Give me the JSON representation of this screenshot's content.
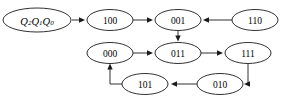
{
  "diagram": {
    "kind": "state-transition-diagram",
    "title": "",
    "background_color": "#ffffff",
    "stroke_color": "#1a1a1a",
    "label_color": "#000000",
    "legend": {
      "name": "state-encoding-legend",
      "text": "Q2Q1Q0",
      "parts": [
        {
          "base": "Q",
          "sub": "2"
        },
        {
          "base": "Q",
          "sub": "1"
        },
        {
          "base": "Q",
          "sub": "0"
        }
      ],
      "cx": 37,
      "cy": 20,
      "rx": 34,
      "ry": 12
    },
    "nodes": [
      {
        "id": "100",
        "label": "100",
        "cx": 110,
        "cy": 20,
        "rx": 23,
        "ry": 10.5,
        "row": "top"
      },
      {
        "id": "001",
        "label": "001",
        "cx": 178,
        "cy": 20,
        "rx": 23,
        "ry": 10.5,
        "row": "top"
      },
      {
        "id": "110",
        "label": "110",
        "cx": 255,
        "cy": 20,
        "rx": 23,
        "ry": 10.5,
        "row": "top"
      },
      {
        "id": "000",
        "label": "000",
        "cx": 110,
        "cy": 53,
        "rx": 23,
        "ry": 10.5,
        "row": "middle"
      },
      {
        "id": "011",
        "label": "011",
        "cx": 178,
        "cy": 53,
        "rx": 23,
        "ry": 10.5,
        "row": "middle"
      },
      {
        "id": "111",
        "label": "111",
        "cx": 248,
        "cy": 53,
        "rx": 23,
        "ry": 10.5,
        "row": "middle"
      },
      {
        "id": "101",
        "label": "101",
        "cx": 145,
        "cy": 84,
        "rx": 23,
        "ry": 10.5,
        "row": "bottom"
      },
      {
        "id": "010",
        "label": "010",
        "cx": 220,
        "cy": 84,
        "rx": 23,
        "ry": 10.5,
        "row": "bottom"
      }
    ],
    "edges": [
      {
        "id": "legend-to-100",
        "from": "Q2Q1Q0",
        "to": "100",
        "shape": "straight",
        "points": "72,20 85,20",
        "arrow_at": "85,20",
        "arrow_dir": "right"
      },
      {
        "id": "100-to-001",
        "from": "100",
        "to": "001",
        "shape": "straight",
        "points": "133,20 153,20",
        "arrow_at": "153,20",
        "arrow_dir": "right"
      },
      {
        "id": "110-to-001",
        "from": "110",
        "to": "001",
        "shape": "straight",
        "points": "232,20 203,20",
        "arrow_at": "203,20",
        "arrow_dir": "left"
      },
      {
        "id": "001-to-011",
        "from": "001",
        "to": "011",
        "shape": "straight",
        "points": "178,31 178,40",
        "arrow_at": "178,40",
        "arrow_dir": "down"
      },
      {
        "id": "000-to-011",
        "from": "000",
        "to": "011",
        "shape": "straight",
        "points": "133,53 153,53",
        "arrow_at": "153,53",
        "arrow_dir": "right"
      },
      {
        "id": "011-to-111",
        "from": "011",
        "to": "111",
        "shape": "straight",
        "points": "201,53 223,53",
        "arrow_at": "223,53",
        "arrow_dir": "right"
      },
      {
        "id": "111-to-010",
        "from": "111",
        "to": "010",
        "shape": "elbow",
        "points": "248,64 248,84 245,84",
        "arrow_at": "245,84",
        "arrow_dir": "left"
      },
      {
        "id": "010-to-101",
        "from": "010",
        "to": "101",
        "shape": "straight",
        "points": "197,84 171,84",
        "arrow_at": "171,84",
        "arrow_dir": "left"
      },
      {
        "id": "101-to-000",
        "from": "101",
        "to": "000",
        "shape": "elbow",
        "points": "122,84 110,84 110,65",
        "arrow_at": "110,65",
        "arrow_dir": "up"
      }
    ]
  }
}
